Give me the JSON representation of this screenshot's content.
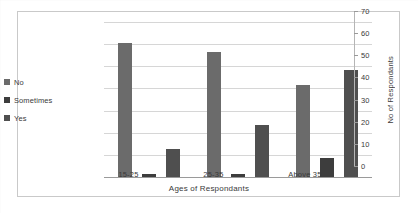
{
  "chart_data": {
    "type": "bar",
    "title": "",
    "categories": [
      "15-25",
      "25-35",
      "Above 35"
    ],
    "series": [
      {
        "name": "No",
        "values": [
          61,
          57,
          42
        ],
        "color": "#6b6b6b"
      },
      {
        "name": "Sometimes",
        "values": [
          2,
          2,
          9
        ],
        "color": "#3d3d3d"
      },
      {
        "name": "Yes",
        "values": [
          13,
          24,
          49
        ],
        "color": "#4f4f4f"
      }
    ],
    "xlabel": "Ages of Respondants",
    "ylabel": "No of Respondants",
    "ylim": [
      0,
      70
    ],
    "ytick_step": 10,
    "yticks": [
      "70",
      "60",
      "50",
      "40",
      "30",
      "20",
      "10",
      "0"
    ],
    "grid": true,
    "grid_axis": "y",
    "legend_position": "left",
    "axis_position": "right"
  },
  "legend": {
    "items": [
      {
        "label": "No",
        "color": "#6b6b6b"
      },
      {
        "label": "Sometimes",
        "color": "#3d3d3d"
      },
      {
        "label": "Yes",
        "color": "#4f4f4f"
      }
    ]
  },
  "colors": {
    "plot_border": "#c9c9c9",
    "gridline": "#d6d6d6",
    "axis": "#9a9a9a",
    "text": "#3a3a3a",
    "background": "#ffffff"
  }
}
